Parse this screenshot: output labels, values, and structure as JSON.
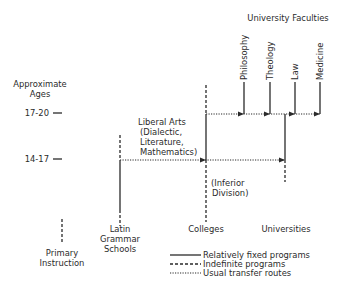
{
  "title": "University Faculties",
  "axis": {
    "label_line1": "Approximate",
    "label_line2": "Ages",
    "ticks": [
      {
        "label": "17-20",
        "y": 113
      },
      {
        "label": "14-17",
        "y": 159
      }
    ]
  },
  "faculties": [
    {
      "name": "Philosophy",
      "x": 244
    },
    {
      "name": "Theology",
      "x": 270
    },
    {
      "name": "Law",
      "x": 295
    },
    {
      "name": "Medicine",
      "x": 320
    }
  ],
  "institutions": {
    "primary": {
      "line1": "Primary",
      "line2": "Instruction"
    },
    "latin": {
      "line1": "Latin",
      "line2": "Grammar",
      "line3": "Schools"
    },
    "colleges": {
      "label": "Colleges"
    },
    "universities": {
      "label": "Universities"
    }
  },
  "liberal_arts": {
    "line1": "Liberal Arts",
    "line2": "(Dialectic,",
    "line3": "Literature,",
    "line4": "Mathematics)"
  },
  "inferior_division": {
    "line1": "(Inferior",
    "line2": "Division)"
  },
  "legend": [
    {
      "style": "solid",
      "label": "Relatively fixed programs"
    },
    {
      "style": "dashed",
      "label": "Indefinite programs"
    },
    {
      "style": "dotted",
      "label": "Usual transfer routes"
    }
  ],
  "colors": {
    "ink": "#2a2a2a",
    "background": "#ffffff"
  }
}
